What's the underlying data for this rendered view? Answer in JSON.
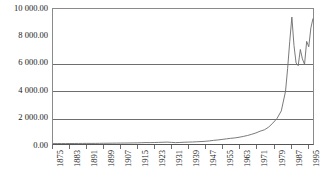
{
  "chart_data": {
    "type": "line",
    "title": "",
    "subtitle": "",
    "xlabel": "",
    "ylabel": "",
    "grid": true,
    "legend": false,
    "legend_position": "none",
    "line_color": "#6b6b6b",
    "axis_color": "#6e6e6e",
    "xlim": [
      1875,
      1998
    ],
    "ylim": [
      0,
      10000
    ],
    "y_ticks": [
      0,
      2000,
      4000,
      6000,
      8000,
      10000
    ],
    "y_tick_labels": [
      "0.00",
      "2 000.00",
      "4 000.00",
      "6 000.00",
      "8 000.00",
      "10 000.00"
    ],
    "x_tick_labels": [
      "1875",
      "1883",
      "1891",
      "1899",
      "1907",
      "1915",
      "1923",
      "1931",
      "1939",
      "1947",
      "1955",
      "1963",
      "1971",
      "1979",
      "1987",
      "1995"
    ],
    "x": [
      1875,
      1877,
      1879,
      1881,
      1883,
      1885,
      1887,
      1889,
      1891,
      1893,
      1895,
      1897,
      1899,
      1901,
      1903,
      1905,
      1907,
      1909,
      1911,
      1913,
      1915,
      1917,
      1919,
      1921,
      1923,
      1925,
      1927,
      1929,
      1931,
      1933,
      1935,
      1937,
      1939,
      1941,
      1943,
      1945,
      1947,
      1949,
      1951,
      1953,
      1955,
      1957,
      1959,
      1961,
      1963,
      1965,
      1967,
      1969,
      1971,
      1973,
      1975,
      1977,
      1979,
      1981,
      1983,
      1985,
      1986,
      1987,
      1988,
      1989,
      1990,
      1991,
      1992,
      1993,
      1994,
      1995,
      1996,
      1997,
      1998
    ],
    "values": [
      30,
      32,
      34,
      33,
      35,
      38,
      40,
      42,
      45,
      44,
      46,
      50,
      55,
      58,
      62,
      66,
      70,
      72,
      75,
      80,
      85,
      95,
      105,
      100,
      110,
      120,
      130,
      140,
      120,
      100,
      115,
      130,
      140,
      150,
      165,
      180,
      200,
      230,
      270,
      300,
      340,
      380,
      420,
      450,
      500,
      560,
      630,
      720,
      820,
      950,
      1050,
      1250,
      1550,
      1900,
      2450,
      3900,
      5600,
      7600,
      9400,
      7300,
      6000,
      5800,
      7000,
      6300,
      5900,
      7600,
      7200,
      8600,
      9300
    ]
  }
}
